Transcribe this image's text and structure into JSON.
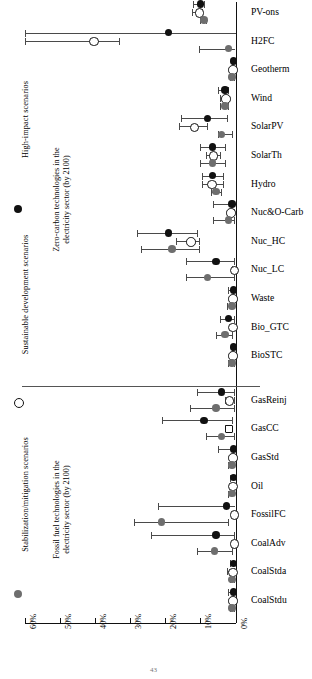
{
  "chart_data": {
    "type": "scatter",
    "title": "",
    "xlabel": "",
    "ylabel": "",
    "orientation": "horizontal",
    "xlim": [
      60,
      0
    ],
    "xticks": [
      "60%",
      "50%",
      "40%",
      "30%",
      "20%",
      "10%",
      "0%"
    ],
    "xtick_values": [
      60,
      50,
      40,
      30,
      20,
      10,
      0
    ],
    "grid": false,
    "legend_position": "left-outside",
    "series": [
      {
        "name": "High-impact scenarios",
        "marker": "filled-black",
        "color": "#111111"
      },
      {
        "name": "Sustainable development scenarios",
        "marker": "open-circle",
        "color": "#ffffff"
      },
      {
        "name": "Stabilization/mitigation scenarios",
        "marker": "filled-gray",
        "color": "#6e6e6e"
      }
    ],
    "groups": [
      {
        "label": "Zero-carbon technologies in the electricity sector (by 2100)",
        "categories": [
          "PV-ons",
          "H2FC",
          "Geotherm",
          "Wind",
          "SolarPV",
          "SolarTh",
          "Hydro",
          "Nuc&O-Carb",
          "Nuc_HC",
          "Nuc_LC",
          "Waste",
          "Bio_GTC",
          "BioSTC"
        ]
      },
      {
        "label": "Fossil fuel technologies in the electricity sector (by 2100)",
        "categories": [
          "GasReinj",
          "GasCC",
          "GasStd",
          "Oil",
          "FossilFC",
          "CoalAdv",
          "CoalStda",
          "CoalStdu"
        ]
      }
    ],
    "categories": [
      "PV-ons",
      "H2FC",
      "Geotherm",
      "Wind",
      "SolarPV",
      "SolarTh",
      "Hydro",
      "Nuc&O-Carb",
      "Nuc_HC",
      "Nuc_LC",
      "Waste",
      "Bio_GTC",
      "BioSTC",
      "GasReinj",
      "GasCC",
      "GasStd",
      "Oil",
      "FossilFC",
      "CoalAdv",
      "CoalStda",
      "CoalStdu"
    ],
    "points": [
      {
        "category": "PV-ons",
        "series": "High-impact scenarios",
        "value": 10.0,
        "low": 12.0,
        "high": 9.0
      },
      {
        "category": "PV-ons",
        "series": "Sustainable development scenarios",
        "value": 10.5,
        "low": 12.5,
        "high": 9.5
      },
      {
        "category": "PV-ons",
        "series": "Stabilization/mitigation scenarios",
        "value": 9.0,
        "low": 10.0,
        "high": 8.5
      },
      {
        "category": "H2FC",
        "series": "High-impact scenarios",
        "value": 19.0,
        "low": 60.0,
        "high": 0.0
      },
      {
        "category": "H2FC",
        "series": "Sustainable development scenarios",
        "value": 40.5,
        "low": 60.0,
        "high": 33.0
      },
      {
        "category": "H2FC",
        "series": "Stabilization/mitigation scenarios",
        "value": 2.0,
        "low": 10.5,
        "high": 0.0
      },
      {
        "category": "Geotherm",
        "series": "High-impact scenarios",
        "value": 0.5,
        "low": 1.0,
        "high": 0.0
      },
      {
        "category": "Geotherm",
        "series": "Sustainable development scenarios",
        "value": 1.0,
        "low": 1.5,
        "high": 0.5
      },
      {
        "category": "Geotherm",
        "series": "Stabilization/mitigation scenarios",
        "value": 1.0,
        "low": 1.5,
        "high": 0.5
      },
      {
        "category": "Wind",
        "series": "High-impact scenarios",
        "value": 3.0,
        "low": 5.0,
        "high": 2.0
      },
      {
        "category": "Wind",
        "series": "Sustainable development scenarios",
        "value": 3.0,
        "low": 4.5,
        "high": 2.0
      },
      {
        "category": "Wind",
        "series": "Stabilization/mitigation scenarios",
        "value": 3.0,
        "low": 4.5,
        "high": 2.0
      },
      {
        "category": "SolarPV",
        "series": "High-impact scenarios",
        "value": 8.0,
        "low": 15.5,
        "high": 2.5
      },
      {
        "category": "SolarPV",
        "series": "Sustainable development scenarios",
        "value": 12.0,
        "low": 16.0,
        "high": 8.0
      },
      {
        "category": "SolarPV",
        "series": "Stabilization/mitigation scenarios",
        "value": 4.0,
        "low": 5.0,
        "high": 1.0
      },
      {
        "category": "SolarTh",
        "series": "High-impact scenarios",
        "value": 6.5,
        "low": 10.0,
        "high": 3.0
      },
      {
        "category": "SolarTh",
        "series": "Sustainable development scenarios",
        "value": 6.5,
        "low": 8.5,
        "high": 4.5
      },
      {
        "category": "SolarTh",
        "series": "Stabilization/mitigation scenarios",
        "value": 6.5,
        "low": 10.0,
        "high": 3.0
      },
      {
        "category": "Hydro",
        "series": "High-impact scenarios",
        "value": 6.5,
        "low": 9.5,
        "high": 3.5
      },
      {
        "category": "Hydro",
        "series": "Sustainable development scenarios",
        "value": 7.0,
        "low": 9.5,
        "high": 3.5
      },
      {
        "category": "Hydro",
        "series": "Stabilization/mitigation scenarios",
        "value": 5.5,
        "low": 7.0,
        "high": 4.0
      },
      {
        "category": "Nuc&O-Carb",
        "series": "High-impact scenarios",
        "value": 1.0,
        "low": 6.5,
        "high": 0.0
      },
      {
        "category": "Nuc&O-Carb",
        "series": "Sustainable development scenarios",
        "value": 1.5,
        "low": 2.0,
        "high": 0.5
      },
      {
        "category": "Nuc&O-Carb",
        "series": "Stabilization/mitigation scenarios",
        "value": 2.0,
        "low": 6.5,
        "high": 0.5
      },
      {
        "category": "Nuc_HC",
        "series": "High-impact scenarios",
        "value": 19.0,
        "low": 28.0,
        "high": 11.0
      },
      {
        "category": "Nuc_HC",
        "series": "Sustainable development scenarios",
        "value": 13.0,
        "low": 17.0,
        "high": 10.5
      },
      {
        "category": "Nuc_HC",
        "series": "Stabilization/mitigation scenarios",
        "value": 18.0,
        "low": 27.0,
        "high": 10.5
      },
      {
        "category": "Nuc_LC",
        "series": "High-impact scenarios",
        "value": 5.5,
        "low": 14.0,
        "high": 0.5
      },
      {
        "category": "Nuc_LC",
        "series": "Sustainable development scenarios",
        "value": 0.5,
        "low": 1.0,
        "high": 0.0
      },
      {
        "category": "Nuc_LC",
        "series": "Stabilization/mitigation scenarios",
        "value": 8.0,
        "low": 14.0,
        "high": 0.5
      },
      {
        "category": "Waste",
        "series": "High-impact scenarios",
        "value": 0.5,
        "low": 2.0,
        "high": 0.0
      },
      {
        "category": "Waste",
        "series": "Sustainable development scenarios",
        "value": 1.0,
        "low": 1.5,
        "high": 0.5
      },
      {
        "category": "Waste",
        "series": "Stabilization/mitigation scenarios",
        "value": 1.0,
        "low": 2.5,
        "high": 0.0
      },
      {
        "category": "Bio_GTC",
        "series": "High-impact scenarios",
        "value": 2.0,
        "low": 4.5,
        "high": 0.5
      },
      {
        "category": "Bio_GTC",
        "series": "Sustainable development scenarios",
        "value": 1.0,
        "low": 1.5,
        "high": 0.5
      },
      {
        "category": "Bio_GTC",
        "series": "Stabilization/mitigation scenarios",
        "value": 3.0,
        "low": 5.5,
        "high": 1.0
      },
      {
        "category": "BioSTC",
        "series": "High-impact scenarios",
        "value": 0.5,
        "low": 1.0,
        "high": 0.0
      },
      {
        "category": "BioSTC",
        "series": "Sustainable development scenarios",
        "value": 1.0,
        "low": 1.5,
        "high": 0.5
      },
      {
        "category": "BioSTC",
        "series": "Stabilization/mitigation scenarios",
        "value": 1.0,
        "low": 2.0,
        "high": 0.5
      },
      {
        "category": "GasReinj",
        "series": "High-impact scenarios",
        "value": 4.0,
        "low": 11.0,
        "high": 0.5
      },
      {
        "category": "GasReinj",
        "series": "Sustainable development scenarios",
        "value": 2.0,
        "low": 3.0,
        "high": 0.5
      },
      {
        "category": "GasReinj",
        "series": "Stabilization/mitigation scenarios",
        "value": 5.5,
        "low": 13.0,
        "high": 0.5
      },
      {
        "category": "GasCC",
        "series": "High-impact scenarios",
        "value": 9.0,
        "low": 21.0,
        "high": 1.0
      },
      {
        "category": "GasCC",
        "series": "Sustainable development scenarios",
        "value": 2.0,
        "low": 3.0,
        "high": 1.5
      },
      {
        "category": "GasCC",
        "series": "Stabilization/mitigation scenarios",
        "value": 4.0,
        "low": 8.5,
        "high": 0.5
      },
      {
        "category": "GasStd",
        "series": "High-impact scenarios",
        "value": 0.5,
        "low": 5.0,
        "high": 0.0
      },
      {
        "category": "GasStd",
        "series": "Sustainable development scenarios",
        "value": 1.0,
        "low": 1.5,
        "high": 0.5
      },
      {
        "category": "GasStd",
        "series": "Stabilization/mitigation scenarios",
        "value": 1.0,
        "low": 2.0,
        "high": 0.0
      },
      {
        "category": "Oil",
        "series": "High-impact scenarios",
        "value": 0.5,
        "low": 1.5,
        "high": 0.0
      },
      {
        "category": "Oil",
        "series": "Sustainable development scenarios",
        "value": 1.0,
        "low": 1.5,
        "high": 0.5
      },
      {
        "category": "Oil",
        "series": "Stabilization/mitigation scenarios",
        "value": 1.0,
        "low": 2.0,
        "high": 0.0
      },
      {
        "category": "FossilFC",
        "series": "High-impact scenarios",
        "value": 2.5,
        "low": 22.0,
        "high": 0.0
      },
      {
        "category": "FossilFC",
        "series": "Sustainable development scenarios",
        "value": 0.5,
        "low": 1.0,
        "high": 0.0
      },
      {
        "category": "FossilFC",
        "series": "Stabilization/mitigation scenarios",
        "value": 21.0,
        "low": 29.0,
        "high": 2.0
      },
      {
        "category": "CoalAdv",
        "series": "High-impact scenarios",
        "value": 5.5,
        "low": 24.0,
        "high": 0.5
      },
      {
        "category": "CoalAdv",
        "series": "Sustainable development scenarios",
        "value": 0.5,
        "low": 1.0,
        "high": 0.0
      },
      {
        "category": "CoalAdv",
        "series": "Stabilization/mitigation scenarios",
        "value": 6.0,
        "low": 11.0,
        "high": 1.0
      },
      {
        "category": "CoalStda",
        "series": "High-impact scenarios",
        "value": 0.5,
        "low": 1.5,
        "high": 0.0
      },
      {
        "category": "CoalStda",
        "series": "Sustainable development scenarios",
        "value": 1.0,
        "low": 2.5,
        "high": 0.5
      },
      {
        "category": "CoalStda",
        "series": "Stabilization/mitigation scenarios",
        "value": 1.0,
        "low": 1.5,
        "high": 0.5
      },
      {
        "category": "CoalStdu",
        "series": "High-impact scenarios",
        "value": 0.5,
        "low": 2.0,
        "high": 0.0
      },
      {
        "category": "CoalStdu",
        "series": "Sustainable development scenarios",
        "value": 1.0,
        "low": 1.5,
        "high": 0.5
      },
      {
        "category": "CoalStdu",
        "series": "Stabilization/mitigation scenarios",
        "value": 1.0,
        "low": 1.5,
        "high": 0.5
      }
    ]
  },
  "legend": {
    "items": [
      {
        "label": "High-impact scenarios",
        "marker": "filled-black"
      },
      {
        "label": "Sustainable development scenarios",
        "marker": "open-circle"
      },
      {
        "label": "Stabilization/mitigation scenarios",
        "marker": "filled-gray"
      }
    ]
  },
  "group_labels": {
    "zero_carbon_line1": "Zero-carbon technologies in the",
    "zero_carbon_line2": "electricity sector (by 2100)",
    "fossil_line1": "Fossil fuel technologies in the",
    "fossil_line2": "electricity sector (by 2100)"
  },
  "footer": {
    "page_number": "43"
  }
}
